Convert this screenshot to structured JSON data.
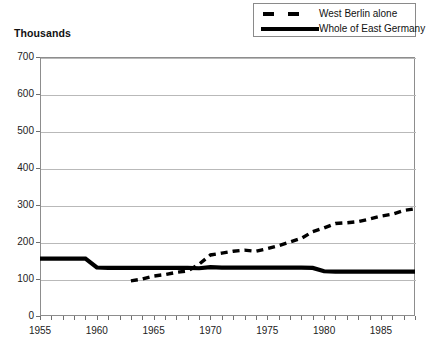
{
  "axis_note": "Thousands",
  "legend": {
    "position": "top-right",
    "entries": [
      {
        "label": "West Berlin alone",
        "style": "dashed",
        "color": "#000000",
        "icon": "dashed-line-swatch"
      },
      {
        "label": "Whole of East Germany",
        "style": "solid",
        "color": "#000000",
        "icon": "solid-line-swatch"
      }
    ]
  },
  "chart_data": {
    "type": "line",
    "title": "",
    "subtitle": "",
    "xlabel": "",
    "ylabel": "Thousands",
    "ylim": [
      0,
      700
    ],
    "xlim": [
      1955,
      1988
    ],
    "ytick_labels": [
      "0",
      "100",
      "200",
      "300",
      "400",
      "500",
      "600",
      "700"
    ],
    "ytick_values": [
      0,
      100,
      200,
      300,
      400,
      500,
      600,
      700
    ],
    "xtick_labels": [
      "1955",
      "1960",
      "1965",
      "1970",
      "1975",
      "1980",
      "1985"
    ],
    "xtick_values": [
      1955,
      1960,
      1965,
      1970,
      1975,
      1980,
      1985
    ],
    "minor_xticks_every": 1,
    "grid": "horizontal",
    "legend_position": "top-right",
    "series": [
      {
        "name": "West Berlin alone",
        "style": "dashed",
        "color": "#000000",
        "x": [
          1963,
          1964,
          1965,
          1966,
          1967,
          1968,
          1969,
          1970,
          1971,
          1972,
          1973,
          1974,
          1975,
          1976,
          1977,
          1978,
          1979,
          1980,
          1981,
          1982,
          1983,
          1984,
          1985,
          1986,
          1987,
          1988
        ],
        "values": [
          95,
          100,
          108,
          112,
          118,
          122,
          140,
          165,
          170,
          175,
          178,
          175,
          182,
          190,
          200,
          210,
          228,
          238,
          250,
          252,
          255,
          262,
          270,
          275,
          285,
          290
        ]
      },
      {
        "name": "Whole of East Germany",
        "style": "solid",
        "color": "#000000",
        "x": [
          1955,
          1956,
          1957,
          1958,
          1959,
          1960,
          1961,
          1962,
          1963,
          1964,
          1965,
          1966,
          1967,
          1968,
          1969,
          1970,
          1971,
          1972,
          1973,
          1974,
          1975,
          1976,
          1977,
          1978,
          1979,
          1980,
          1981,
          1982,
          1983,
          1984,
          1985,
          1986,
          1987,
          1988
        ],
        "values": [
          155,
          155,
          155,
          155,
          155,
          131,
          130,
          130,
          130,
          130,
          130,
          130,
          130,
          130,
          129,
          132,
          131,
          131,
          131,
          131,
          131,
          131,
          131,
          131,
          130,
          121,
          120,
          120,
          120,
          120,
          120,
          120,
          120,
          120
        ]
      }
    ]
  }
}
